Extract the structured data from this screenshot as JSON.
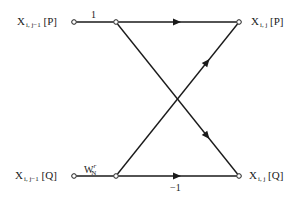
{
  "diagram": {
    "type": "butterfly signal-flow graph",
    "inputs": {
      "top": {
        "base": "X",
        "sub": "i, j−1",
        "bracket": "[P]"
      },
      "bottom": {
        "base": "X",
        "sub": "i, j−1",
        "bracket": "[Q]"
      }
    },
    "outputs": {
      "top": {
        "base": "X",
        "sub": "i, j",
        "bracket": "[P]"
      },
      "bottom": {
        "base": "X",
        "sub": "i, j",
        "bracket": "[Q]"
      }
    },
    "weights": {
      "top_input_branch": "1",
      "bottom_input_branch_base": "W",
      "bottom_input_branch_sub": "N",
      "bottom_input_branch_sup": "r",
      "bottom_output_branch": "−1"
    },
    "nodes": [
      {
        "id": "in-p",
        "x": 74,
        "y": 22
      },
      {
        "id": "mid-p",
        "x": 116,
        "y": 22
      },
      {
        "id": "out-p",
        "x": 239,
        "y": 22
      },
      {
        "id": "in-q",
        "x": 74,
        "y": 176
      },
      {
        "id": "mid-q",
        "x": 116,
        "y": 176
      },
      {
        "id": "out-q",
        "x": 239,
        "y": 176
      }
    ],
    "edges": [
      {
        "from": "in-p",
        "to": "mid-p",
        "arrow": false
      },
      {
        "from": "mid-p",
        "to": "out-p",
        "arrow": true
      },
      {
        "from": "mid-p",
        "to": "out-q",
        "arrow": true
      },
      {
        "from": "in-q",
        "to": "mid-q",
        "arrow": false
      },
      {
        "from": "mid-q",
        "to": "out-p",
        "arrow": true
      },
      {
        "from": "mid-q",
        "to": "out-q",
        "arrow": true
      }
    ]
  }
}
